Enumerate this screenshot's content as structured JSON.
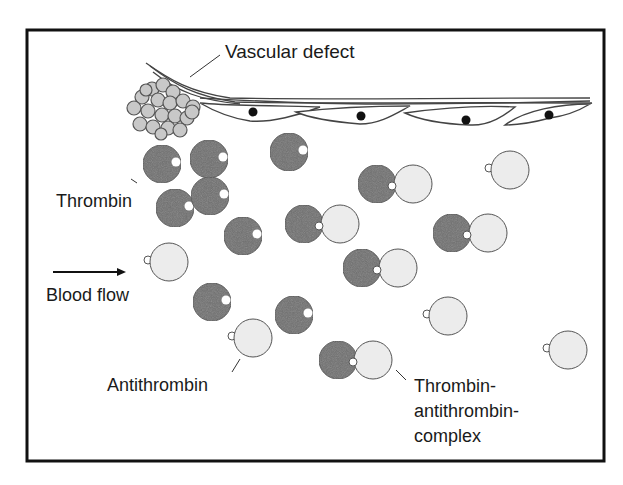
{
  "diagram": {
    "labels": {
      "vascular_defect": "Vascular defect",
      "thrombin": "Thrombin",
      "blood_flow": "Blood flow",
      "antithrombin": "Antithrombin",
      "complex_line1": "Thrombin-",
      "complex_line2": "antithrombin-",
      "complex_line3": "complex"
    },
    "colors": {
      "frame": "#111111",
      "thrombin_fill": "#6e6e6e",
      "antithrombin_fill": "#ececec",
      "platelet_fill": "#c8c8c8",
      "outline": "#555555",
      "nucleus": "#111111"
    },
    "thrombin": [
      {
        "cx": 162,
        "cy": 164
      },
      {
        "cx": 209,
        "cy": 159
      },
      {
        "cx": 289,
        "cy": 152
      },
      {
        "cx": 175,
        "cy": 208
      },
      {
        "cx": 210,
        "cy": 196
      },
      {
        "cx": 243,
        "cy": 236
      },
      {
        "cx": 212,
        "cy": 302
      },
      {
        "cx": 294,
        "cy": 315
      }
    ],
    "antithrombin": [
      {
        "cx": 169,
        "cy": 262
      },
      {
        "cx": 510,
        "cy": 170
      },
      {
        "cx": 253,
        "cy": 338
      },
      {
        "cx": 448,
        "cy": 316
      },
      {
        "cx": 568,
        "cy": 350
      }
    ],
    "complexes": [
      {
        "tx": 377,
        "ty": 184,
        "ax": 413,
        "ay": 184
      },
      {
        "tx": 304,
        "ty": 224,
        "ax": 340,
        "ay": 224
      },
      {
        "tx": 452,
        "ty": 233,
        "ax": 488,
        "ay": 233
      },
      {
        "tx": 362,
        "ty": 268,
        "ax": 398,
        "ay": 268
      },
      {
        "tx": 338,
        "ty": 360,
        "ax": 373,
        "ay": 360
      }
    ]
  }
}
